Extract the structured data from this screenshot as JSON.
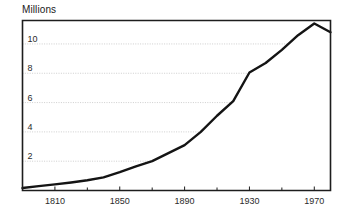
{
  "chart_data": {
    "type": "line",
    "title": "Millions",
    "xlabel": "",
    "ylabel": "Millions",
    "grid": true,
    "legend": false,
    "xlim": [
      1790,
      1980
    ],
    "ylim": [
      0,
      11.6
    ],
    "y_ticks": [
      2,
      4,
      6,
      8,
      10
    ],
    "y_tick_labels": [
      "2",
      "4",
      "6",
      "8",
      "10"
    ],
    "x_ticks": [
      1810,
      1850,
      1890,
      1930,
      1970
    ],
    "x_tick_labels": [
      "1810",
      "1850",
      "1890",
      "1930",
      "1970"
    ],
    "x_minor_ticks": [
      1830,
      1870,
      1910,
      1950
    ],
    "series": [
      {
        "name": "Population",
        "x": [
          1790,
          1800,
          1810,
          1820,
          1830,
          1840,
          1850,
          1860,
          1870,
          1880,
          1890,
          1900,
          1910,
          1920,
          1930,
          1940,
          1950,
          1960,
          1970,
          1980
        ],
        "values": [
          0.17,
          0.3,
          0.42,
          0.55,
          0.7,
          0.9,
          1.25,
          1.65,
          2.0,
          2.55,
          3.1,
          4.0,
          5.1,
          6.1,
          8.05,
          8.7,
          9.6,
          10.6,
          11.4,
          10.8
        ]
      }
    ]
  },
  "axes": {
    "y_axis_name": "value-axis",
    "x_axis_name": "year-axis"
  }
}
